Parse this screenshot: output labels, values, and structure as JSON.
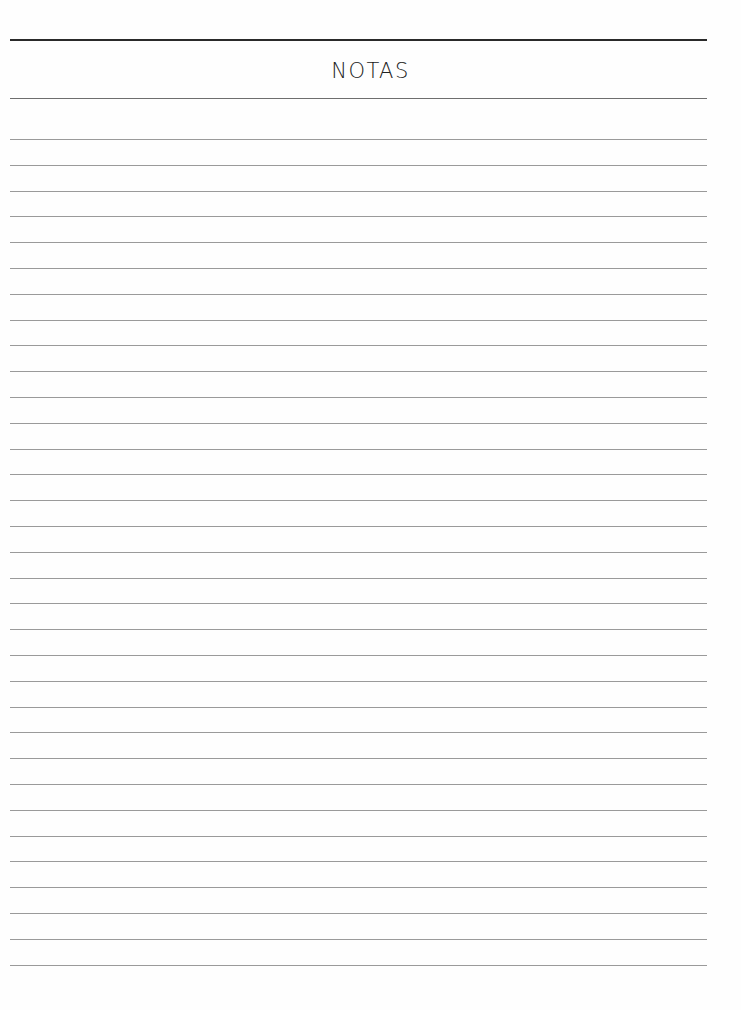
{
  "page": {
    "title": "NOTAS",
    "ruled_line_count": 33,
    "first_line_y": 139,
    "line_spacing_px": 25.8,
    "colors": {
      "background": "#fefefe",
      "header_rule": "#2a2a2a",
      "ruled_line": "#9a9a9a",
      "text": "#222222"
    }
  }
}
